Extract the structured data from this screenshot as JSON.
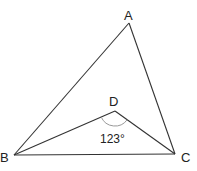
{
  "diagram": {
    "type": "geometry-triangle",
    "points": {
      "A": {
        "label": "A",
        "x": 129,
        "y": 23
      },
      "B": {
        "label": "B",
        "x": 14,
        "y": 155
      },
      "C": {
        "label": "C",
        "x": 175,
        "y": 154
      },
      "D": {
        "label": "D",
        "x": 115,
        "y": 111
      }
    },
    "segments": [
      "AB",
      "AC",
      "BC",
      "BD",
      "DC"
    ],
    "angle": {
      "vertex": "D",
      "label": "123°"
    },
    "colors": {
      "line": "#333333",
      "arc": "#999999",
      "text": "#222222"
    }
  }
}
